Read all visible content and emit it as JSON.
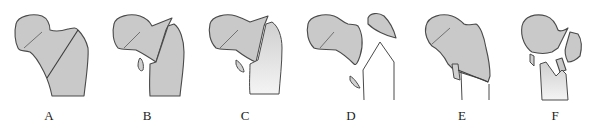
{
  "figure": {
    "panels": [
      {
        "id": "A",
        "label": "A"
      },
      {
        "id": "B",
        "label": "B"
      },
      {
        "id": "C",
        "label": "C"
      },
      {
        "id": "D",
        "label": "D"
      },
      {
        "id": "E",
        "label": "E"
      },
      {
        "id": "F",
        "label": "F"
      }
    ],
    "colors": {
      "bone_fill": "#c9c9c9",
      "outline": "#4a4a4a",
      "background": "#ffffff"
    }
  }
}
